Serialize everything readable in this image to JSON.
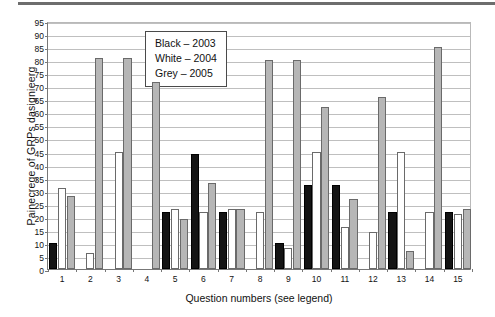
{
  "chart_data": {
    "type": "bar",
    "title": "",
    "xlabel": "Question numbers (see legend)",
    "ylabel": "Painecrege of GRPs dasignieerg",
    "ylim": [
      0,
      95
    ],
    "ytick_step": 5,
    "yticks": [
      0,
      5,
      10,
      15,
      20,
      25,
      30,
      35,
      40,
      45,
      50,
      55,
      60,
      65,
      70,
      75,
      80,
      85,
      90,
      95
    ],
    "grid": true,
    "legend_position": "inside-top-center",
    "categories": [
      "1",
      "2",
      "3",
      "4",
      "5",
      "6",
      "7",
      "8",
      "9",
      "10",
      "11",
      "12",
      "13",
      "14",
      "15"
    ],
    "series": [
      {
        "name": "Black – 2003",
        "color": "#141414",
        "values": [
          10,
          0,
          0,
          0,
          22,
          44,
          22,
          0,
          10,
          32,
          32,
          0,
          22,
          0,
          22
        ]
      },
      {
        "name": "White – 2004",
        "color": "#ffffff",
        "values": [
          31,
          6,
          45,
          0,
          23,
          22,
          23,
          22,
          8,
          45,
          16,
          14,
          45,
          22,
          21
        ]
      },
      {
        "name": "Grey – 2005",
        "color": "#b6b6b6",
        "values": [
          28,
          81,
          81,
          71.5,
          19,
          33,
          23,
          80,
          80,
          62,
          27,
          66,
          7,
          85,
          23
        ]
      }
    ],
    "legend": [
      {
        "label": "Black – 2003"
      },
      {
        "label": "White – 2004"
      },
      {
        "label": "Grey – 2005"
      }
    ]
  }
}
